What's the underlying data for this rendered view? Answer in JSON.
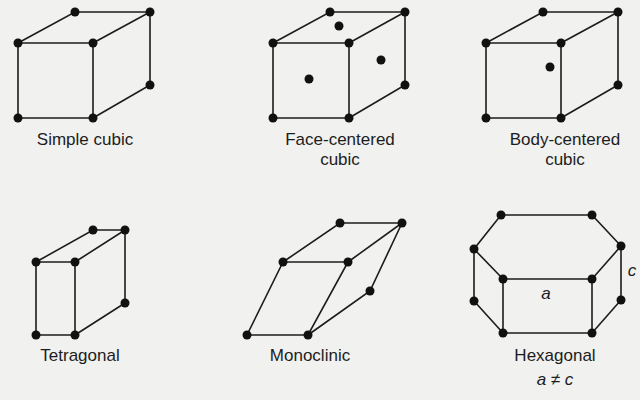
{
  "diagram": {
    "cells": [
      {
        "id": "simple-cubic",
        "label_lines": [
          "Simple cubic"
        ]
      },
      {
        "id": "face-centered-cubic",
        "label_lines": [
          "Face-centered",
          "cubic"
        ]
      },
      {
        "id": "body-centered-cubic",
        "label_lines": [
          "Body-centered",
          "cubic"
        ]
      },
      {
        "id": "tetragonal",
        "label_lines": [
          "Tetragonal"
        ]
      },
      {
        "id": "monoclinic",
        "label_lines": [
          "Monoclinic"
        ]
      },
      {
        "id": "hexagonal",
        "label_lines": [
          "Hexagonal"
        ],
        "annotations": {
          "a": "a",
          "c": "c",
          "relation": "a ≠ c"
        }
      }
    ]
  }
}
